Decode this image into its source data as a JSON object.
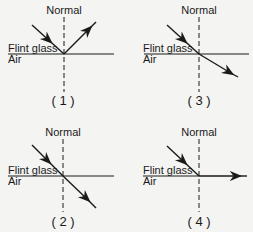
{
  "panels": [
    {
      "id": "1",
      "label": "( 1 )",
      "normal": "Normal",
      "upper_medium": "Flint glass",
      "lower_medium": "Air",
      "behavior": "reflection"
    },
    {
      "id": "2",
      "label": "( 2 )",
      "normal": "Normal",
      "upper_medium": "Flint glass",
      "lower_medium": "Air",
      "behavior": "refraction-toward-normal-straight"
    },
    {
      "id": "3",
      "label": "( 3 )",
      "normal": "Normal",
      "upper_medium": "Flint glass",
      "lower_medium": "Air",
      "behavior": "refraction-away-from-normal"
    },
    {
      "id": "4",
      "label": "( 4 )",
      "normal": "Normal",
      "upper_medium": "Flint glass",
      "lower_medium": "Air",
      "behavior": "critical-angle-along-surface"
    }
  ],
  "colors": {
    "line": "#1a1a1a",
    "background": "#f4f4f2"
  }
}
